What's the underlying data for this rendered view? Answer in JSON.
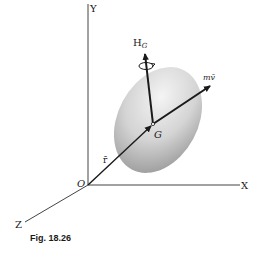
{
  "figure": {
    "caption": "Fig. 18.26",
    "axes": {
      "x_label": "X",
      "y_label": "Y",
      "z_label": "Z",
      "origin_label": "O"
    },
    "body": {
      "center_label": "G",
      "shape": "ellipsoid"
    },
    "vectors": {
      "angular_momentum": {
        "label_main": "H",
        "label_sub": "G"
      },
      "linear_momentum": {
        "label": "mv̄"
      },
      "position": {
        "label": "r̄"
      }
    },
    "colors": {
      "line": "#1a1a1a",
      "body_light": "#f2f2f2",
      "body_dark": "#a8a8a8",
      "background": "#ffffff"
    }
  }
}
